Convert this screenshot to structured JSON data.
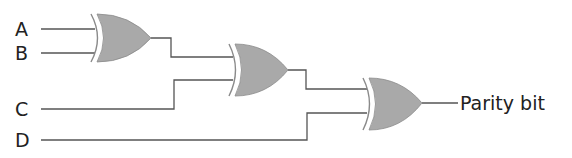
{
  "diagram": {
    "type": "logic-circuit",
    "inputs": [
      {
        "label": "A"
      },
      {
        "label": "B"
      },
      {
        "label": "C"
      },
      {
        "label": "D"
      }
    ],
    "output": {
      "label": "Parity bit"
    },
    "gates": [
      {
        "id": "xor1",
        "type": "XOR",
        "inputs": [
          "A",
          "B"
        ]
      },
      {
        "id": "xor2",
        "type": "XOR",
        "inputs": [
          "xor1",
          "C"
        ]
      },
      {
        "id": "xor3",
        "type": "XOR",
        "inputs": [
          "xor2",
          "D"
        ]
      }
    ],
    "colors": {
      "gate_fill": "#a9a9a9",
      "wire": "#555555",
      "text": "#222222"
    }
  }
}
